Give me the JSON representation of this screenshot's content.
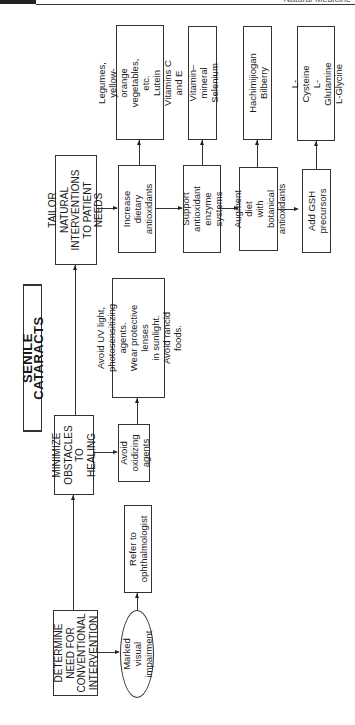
{
  "page_header": {
    "running_title": "Natural Medicine"
  },
  "diagram": {
    "title": "SENILE CATARACTS",
    "main_steps": [
      {
        "id": "determine",
        "label": "DETERMINE\nNEED FOR\nCONVENTIONAL\nINTERVENTION"
      },
      {
        "id": "minimize",
        "label": "MINIMIZE\nOBSTACLES\nTO HEALING"
      },
      {
        "id": "tailor",
        "label": "TAILOR NATURAL\nINTERVENTIONS\nTO PATIENT NEEDS"
      }
    ],
    "determine_branch": {
      "condition": "Marked visual\nimpairment",
      "action": "Refer to\nophthalmologist"
    },
    "minimize_branch": {
      "action": "Avoid\noxidizing\nagents",
      "detail": "Avoid UV light,\nphotosensitizing agents.\nWear protective lenses\nin sunlight.\nAvoid rancid foods."
    },
    "tailor_branch": [
      {
        "action": "Increase dietary\nantioxidants",
        "detail": "Legumes, yellow-orange\nvegetables, etc.\nLutein\nVitamins C and E"
      },
      {
        "action": "Support\nantioxidant\nenzyme systems",
        "detail": "Vitamin–mineral\nSelenium"
      },
      {
        "action": "Augment diet\nwith botanical\nantioxidants",
        "detail": "Hachimijiogan\nBilberry"
      },
      {
        "action": "Add GSH\nprecursors",
        "detail": "L-Cysteine\nL-Glutamine\nL-Glycine"
      }
    ]
  }
}
